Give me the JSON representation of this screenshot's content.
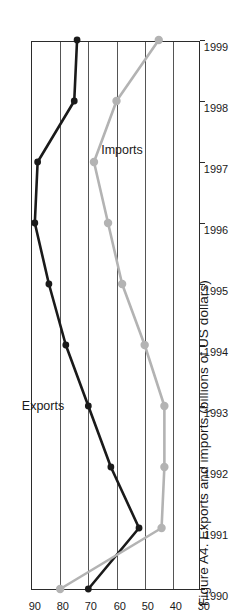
{
  "figure": {
    "title": "Figure A4. Exports and imports (billions of US dollars)",
    "rotation_deg": -90
  },
  "chart_data": {
    "type": "line",
    "title": "Figure A4. Exports and imports (billions of US dollars)",
    "xlabel": "",
    "ylabel": "billions of US dollars",
    "categories": [
      "1990",
      "1991",
      "1992",
      "1993",
      "1994",
      "1995",
      "1996",
      "1997",
      "1998",
      "1999"
    ],
    "x": [
      1990,
      1991,
      1992,
      1993,
      1994,
      1995,
      1996,
      1997,
      1998,
      1999
    ],
    "ylim": [
      30,
      90
    ],
    "yticks": [
      30,
      40,
      50,
      60,
      70,
      80,
      90
    ],
    "ytick_labels": [
      "30",
      "40",
      "50",
      "60",
      "70",
      "80",
      "90"
    ],
    "grid": true,
    "legend": "inline-labels",
    "series": [
      {
        "name": "Exports",
        "color": "#1a1a1a",
        "marker": "circle",
        "values": [
          70,
          52,
          62,
          70,
          78,
          84,
          89,
          88,
          75,
          74
        ]
      },
      {
        "name": "Imports",
        "color": "#b3b3b3",
        "marker": "circle",
        "values": [
          80,
          44,
          43,
          43,
          50,
          58,
          63,
          68,
          60,
          45
        ]
      }
    ],
    "annotations": [
      {
        "text": "Exports",
        "x": 1993.0,
        "y": 86.0
      },
      {
        "text": "Imports",
        "x": 1997.2,
        "y": 58.0
      }
    ]
  }
}
